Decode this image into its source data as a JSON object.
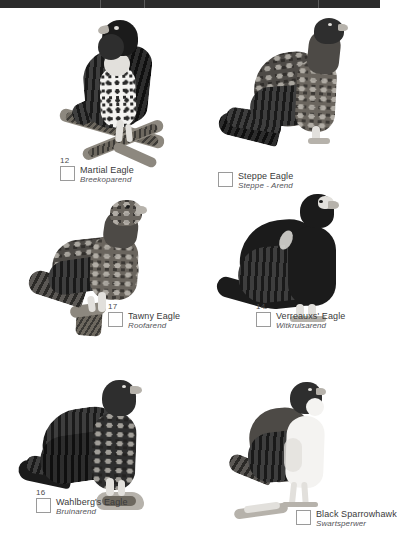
{
  "page": {
    "kind": "field-guide-checklist",
    "background_color": "#ffffff",
    "top_bar_color": "#2b2b2b",
    "text_color": "#3a3a3a",
    "checkbox_border_color": "#9a9a9a"
  },
  "entries": [
    {
      "number": "12",
      "name_en": "Martial Eagle",
      "name_af": "Breekoparend",
      "checked": false,
      "art": "perched-eagle-on-branch-spotted-breast"
    },
    {
      "number": "",
      "name_en": "Steppe Eagle",
      "name_af": "Steppe - Arend",
      "checked": false,
      "art": "standing-eagle-mottled-brown"
    },
    {
      "number": "17",
      "name_en": "Tawny Eagle",
      "name_af": "Roofarend",
      "checked": false,
      "art": "perched-eagle-on-stump-tawny"
    },
    {
      "number": "14",
      "name_en": "Verreauxs' Eagle",
      "name_af": "Witkruisarend",
      "checked": false,
      "art": "standing-black-eagle-pale-face"
    },
    {
      "number": "16",
      "name_en": "Wahlberg's Eagle",
      "name_af": "Bruinarend",
      "checked": false,
      "art": "perched-dark-brown-eagle-on-rock"
    },
    {
      "number": "",
      "name_en": "Black Sparrowhawk",
      "name_af": "Swartsperwer",
      "checked": false,
      "art": "perched-sparrowhawk-white-breast"
    }
  ]
}
